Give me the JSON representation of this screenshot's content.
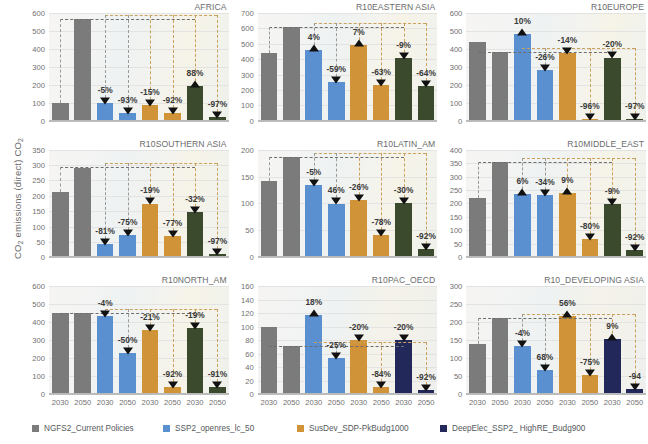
{
  "figure": {
    "ylabel": "CO2 emissions (direct) CO2",
    "xtick_labels": [
      "2030",
      "2050",
      "2030",
      "2050",
      "2030",
      "2050",
      "2030",
      "2050"
    ]
  },
  "legend": {
    "position": "bottom",
    "items": [
      {
        "label": "NGFS2_Current Policies",
        "color": "#7b7b7b"
      },
      {
        "label": "SSP2_openres_lc_50",
        "color": "#5b90d0"
      },
      {
        "label": "SusDev_SDP-PkBudg1000",
        "color": "#d09338"
      },
      {
        "label": "DeepElec_SSP2_ HighRE_Budg900",
        "color": "#23285a"
      }
    ]
  },
  "chart_data": {
    "type": "bar",
    "title": "",
    "xlabel": "",
    "ylabel": "CO2 emissions (direct) CO2",
    "grid": true,
    "categories": [
      "2030",
      "2050",
      "2030",
      "2050",
      "2030",
      "2050",
      "2030",
      "2050"
    ],
    "series_names": [
      "NGFS2_Current Policies",
      "SSP2_openres_lc_50",
      "SusDev_SDP-PkBudg1000",
      "DeepElec_SSP2_ HighRE_Budg900"
    ],
    "panels": [
      {
        "title": "AFRICA",
        "ylim": [
          0,
          600
        ],
        "yticks": [
          0,
          100,
          200,
          300,
          400,
          500,
          600
        ],
        "fourth_color": "#3b4a2c",
        "values": [
          100,
          565,
          98,
          44,
          88,
          45,
          192,
          18
        ],
        "labels": [
          "",
          "",
          "-5%",
          "-93%",
          "-15%",
          "-92%",
          "88%",
          "-97%"
        ],
        "directions": [
          "",
          "",
          "down",
          "down",
          "down",
          "down",
          "up",
          "down"
        ]
      },
      {
        "title": "R10EASTERN ASIA",
        "ylim": [
          0,
          700
        ],
        "yticks": [
          0,
          100,
          200,
          300,
          400,
          500,
          600,
          700
        ],
        "fourth_color": "#3b4a2c",
        "values": [
          440,
          610,
          460,
          252,
          490,
          232,
          405,
          225
        ],
        "labels": [
          "",
          "",
          "4%",
          "-59%",
          "7%",
          "-63%",
          "-9%",
          "-64%"
        ],
        "directions": [
          "",
          "",
          "up",
          "down",
          "up",
          "down",
          "down",
          "down"
        ]
      },
      {
        "title": "R10EUROPE",
        "ylim": [
          0,
          600
        ],
        "yticks": [
          0,
          100,
          200,
          300,
          400,
          500,
          600
        ],
        "fourth_color": "#3b4a2c",
        "values": [
          440,
          380,
          483,
          280,
          378,
          12,
          352,
          8
        ],
        "labels": [
          "",
          "",
          "10%",
          "-26%",
          "-14%",
          "-96%",
          "-20%",
          "-97%"
        ],
        "directions": [
          "",
          "",
          "up",
          "down",
          "down",
          "down",
          "down",
          "down"
        ]
      },
      {
        "title": "R10SOUTHERN ASIA",
        "ylim": [
          0,
          350
        ],
        "yticks": [
          0,
          50,
          100,
          150,
          200,
          250,
          300,
          350
        ],
        "fourth_color": "#3b4a2c",
        "values": [
          213,
          292,
          42,
          72,
          175,
          68,
          148,
          10
        ],
        "labels": [
          "",
          "",
          "-81%",
          "-75%",
          "-19%",
          "-77%",
          "-32%",
          "-97%"
        ],
        "directions": [
          "",
          "",
          "down",
          "down",
          "down",
          "down",
          "down",
          "down"
        ]
      },
      {
        "title": "R10LATIN_AM",
        "ylim": [
          0,
          200
        ],
        "yticks": [
          0,
          50,
          100,
          150,
          200
        ],
        "fourth_color": "#3b4a2c",
        "values": [
          142,
          186,
          135,
          100,
          107,
          41,
          101,
          15
        ],
        "labels": [
          "",
          "",
          "-5%",
          "46%",
          "-26%",
          "-78%",
          "-30%",
          "-92%"
        ],
        "directions": [
          "",
          "",
          "down",
          "down",
          "down",
          "down",
          "down",
          "down"
        ]
      },
      {
        "title": "R10MIDDLE_EAST",
        "ylim": [
          0,
          400
        ],
        "yticks": [
          0,
          50,
          100,
          150,
          200,
          250,
          300,
          350,
          400
        ],
        "fourth_color": "#3b4a2c",
        "values": [
          221,
          354,
          234,
          233,
          240,
          69,
          199,
          29
        ],
        "labels": [
          "",
          "",
          "6%",
          "-34%",
          "9%",
          "-80%",
          "-9%",
          "-92%"
        ],
        "directions": [
          "",
          "",
          "up",
          "down",
          "up",
          "down",
          "down",
          "down"
        ]
      },
      {
        "title": "R10NORTH_AM",
        "ylim": [
          0,
          600
        ],
        "yticks": [
          0,
          100,
          200,
          300,
          400,
          500,
          600
        ],
        "fourth_color": "#3b4a2c",
        "values": [
          450,
          450,
          434,
          226,
          356,
          37,
          368,
          41
        ],
        "labels": [
          "",
          "",
          "-4%",
          "-50%",
          "-21%",
          "-92%",
          "-19%",
          "-91%"
        ],
        "directions": [
          "",
          "",
          "down",
          "down",
          "down",
          "down",
          "down",
          "down"
        ]
      },
      {
        "title": "R10PAC_OECD",
        "ylim": [
          0,
          160
        ],
        "yticks": [
          0,
          20,
          40,
          60,
          80,
          100,
          120,
          140,
          160
        ],
        "fourth_color": "#23285a",
        "values": [
          99,
          71,
          117,
          54,
          80,
          11,
          80,
          6
        ],
        "labels": [
          "",
          "",
          "18%",
          "-25%",
          "-20%",
          "-84%",
          "-20%",
          "-92%"
        ],
        "directions": [
          "",
          "",
          "up",
          "down",
          "down",
          "down",
          "down",
          "down"
        ]
      },
      {
        "title": "R10_DEVELOPING ASIA",
        "ylim": [
          0,
          300
        ],
        "yticks": [
          0,
          50,
          100,
          150,
          200,
          250,
          300
        ],
        "fourth_color": "#23285a",
        "values": [
          140,
          212,
          133,
          67,
          217,
          54,
          152,
          14
        ],
        "labels": [
          "",
          "",
          "-4%",
          "68%",
          "56%",
          "-75%",
          "9%",
          "-94"
        ],
        "directions": [
          "",
          "",
          "down",
          "down",
          "up",
          "down",
          "up",
          "down"
        ]
      }
    ]
  }
}
